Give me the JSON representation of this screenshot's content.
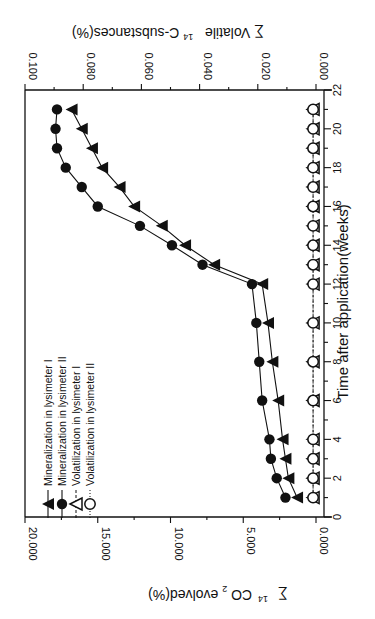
{
  "chart_data": {
    "type": "line",
    "orientation": "rotated 90 degrees clockwise (x-axis on right side, y-axes at bottom and top)",
    "xlabel": "Time after application(weeks)",
    "ylabel_left": "∑ 14CO2 evolved(%)",
    "ylabel_right": "∑ Volatile 14C-substances(%)",
    "x": [
      1,
      2,
      3,
      4,
      6,
      8,
      10,
      12,
      13,
      14,
      15,
      16,
      17,
      18,
      19,
      20,
      21
    ],
    "xlim": [
      0,
      22
    ],
    "xticks": [
      "0",
      "2",
      "4",
      "6",
      "8",
      "10",
      "12",
      "14",
      "16",
      "18",
      "20",
      "22"
    ],
    "ylim_left": [
      0,
      20
    ],
    "yticks_left": [
      "0.000",
      "5.000",
      "10.000",
      "15.000",
      "20.000"
    ],
    "ylim_right": [
      0,
      0.1
    ],
    "yticks_right": [
      "0.000",
      "0.020",
      "0.040",
      "0.060",
      "0.080",
      "0.100"
    ],
    "series": [
      {
        "name": "Mineralization in lysimeter I",
        "marker": "filled-triangle",
        "axis": "left",
        "line": "solid",
        "values": [
          1.3,
          1.9,
          2.1,
          2.3,
          2.6,
          3.0,
          3.3,
          3.7,
          7.0,
          9.0,
          10.6,
          12.5,
          13.5,
          14.7,
          15.4,
          16.1,
          16.8
        ]
      },
      {
        "name": "Mineralization in lysimeter II",
        "marker": "filled-circle",
        "axis": "left",
        "line": "solid",
        "values": [
          2.1,
          2.7,
          3.1,
          3.2,
          3.7,
          3.9,
          4.1,
          4.4,
          7.8,
          9.9,
          12.1,
          15.0,
          16.1,
          17.2,
          17.8,
          17.9,
          17.8
        ]
      },
      {
        "name": "Volatilization in lysimeter I",
        "marker": "open-triangle",
        "axis": "right",
        "line": "dashed",
        "values": [
          0.001,
          0.001,
          0.001,
          0.001,
          0.001,
          0.001,
          0.001,
          0.001,
          0.001,
          0.001,
          0.001,
          0.001,
          0.001,
          0.001,
          0.001,
          0.001,
          0.001
        ]
      },
      {
        "name": "Volatilization in lysimeter II",
        "marker": "open-circle",
        "axis": "right",
        "line": "dotted",
        "values": [
          0.001,
          0.001,
          0.001,
          0.001,
          0.001,
          0.001,
          0.001,
          0.001,
          0.001,
          0.001,
          0.001,
          0.001,
          0.001,
          0.001,
          0.001,
          0.001,
          0.001
        ]
      }
    ],
    "legend": {
      "position": "lower-left (rotated)",
      "entries": [
        "Mineralization in lysimeter I",
        "Mineralization in lysimeter II",
        "Volatilization in lysimeter I",
        "Volatilization in lysimeter II"
      ]
    },
    "grid": false
  },
  "labels": {
    "xlabel": "Time after application(weeks)",
    "ylabel_left_prefix": "∑",
    "ylabel_left_sup": "14",
    "ylabel_left_main": "CO",
    "ylabel_left_sub": "2",
    "ylabel_left_suffix": " evolved(%)",
    "ylabel_right_prefix": "∑ Volatile",
    "ylabel_right_sup": "14",
    "ylabel_right_suffix": "C-substances(%)"
  }
}
